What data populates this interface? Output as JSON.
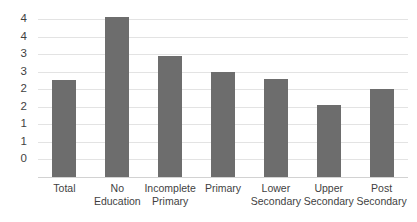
{
  "chart_data": {
    "type": "bar",
    "title": "",
    "subtitle": "",
    "xlabel": "",
    "ylabel": "",
    "categories": [
      "Total",
      "No Education",
      "Incomplete Primary",
      "Primary",
      "Lower Secondary",
      "Upper Secondary",
      "Post Secondary"
    ],
    "values": [
      2.75,
      4.55,
      3.45,
      3.0,
      2.8,
      2.05,
      2.5
    ],
    "ylim": [
      0,
      4.5
    ],
    "ytick_values": [
      4.5,
      4.0,
      3.5,
      3.0,
      2.5,
      2.0,
      1.5,
      1.0,
      0.5,
      0
    ],
    "ytick_labels": [
      "4",
      "4",
      "3",
      "3",
      "2",
      "2",
      "1",
      "1",
      "0"
    ],
    "ytick_labels_displayed": [
      "4",
      "4",
      "3",
      "3",
      "2",
      "2",
      "1",
      "1",
      "0"
    ],
    "grid": true,
    "legend": false,
    "legend_position": "none",
    "series": [
      {
        "name": "",
        "values": [
          2.75,
          4.55,
          3.45,
          3.0,
          2.8,
          2.05,
          2.5
        ]
      }
    ],
    "bar_color": "#6d6d6d",
    "gridline_color": "#e3e3e3",
    "background_color": "#ffffff",
    "axis_text_color": "#3f3f3f"
  },
  "axis": {
    "y_ticks": [
      {
        "label": "4",
        "value": 4.5
      },
      {
        "label": "4",
        "value": 4.0
      },
      {
        "label": "3",
        "value": 3.5
      },
      {
        "label": "3",
        "value": 3.0
      },
      {
        "label": "2",
        "value": 2.5
      },
      {
        "label": "2",
        "value": 2.0
      },
      {
        "label": "1",
        "value": 1.5
      },
      {
        "label": "1",
        "value": 1.0
      },
      {
        "label": "0",
        "value": 0.5
      }
    ],
    "x_ticks": [
      {
        "label": "Total"
      },
      {
        "label": "No Education"
      },
      {
        "label": "Incomplete Primary"
      },
      {
        "label": "Primary"
      },
      {
        "label": "Lower Secondary"
      },
      {
        "label": "Upper Secondary"
      },
      {
        "label": "Post Secondary"
      }
    ]
  }
}
